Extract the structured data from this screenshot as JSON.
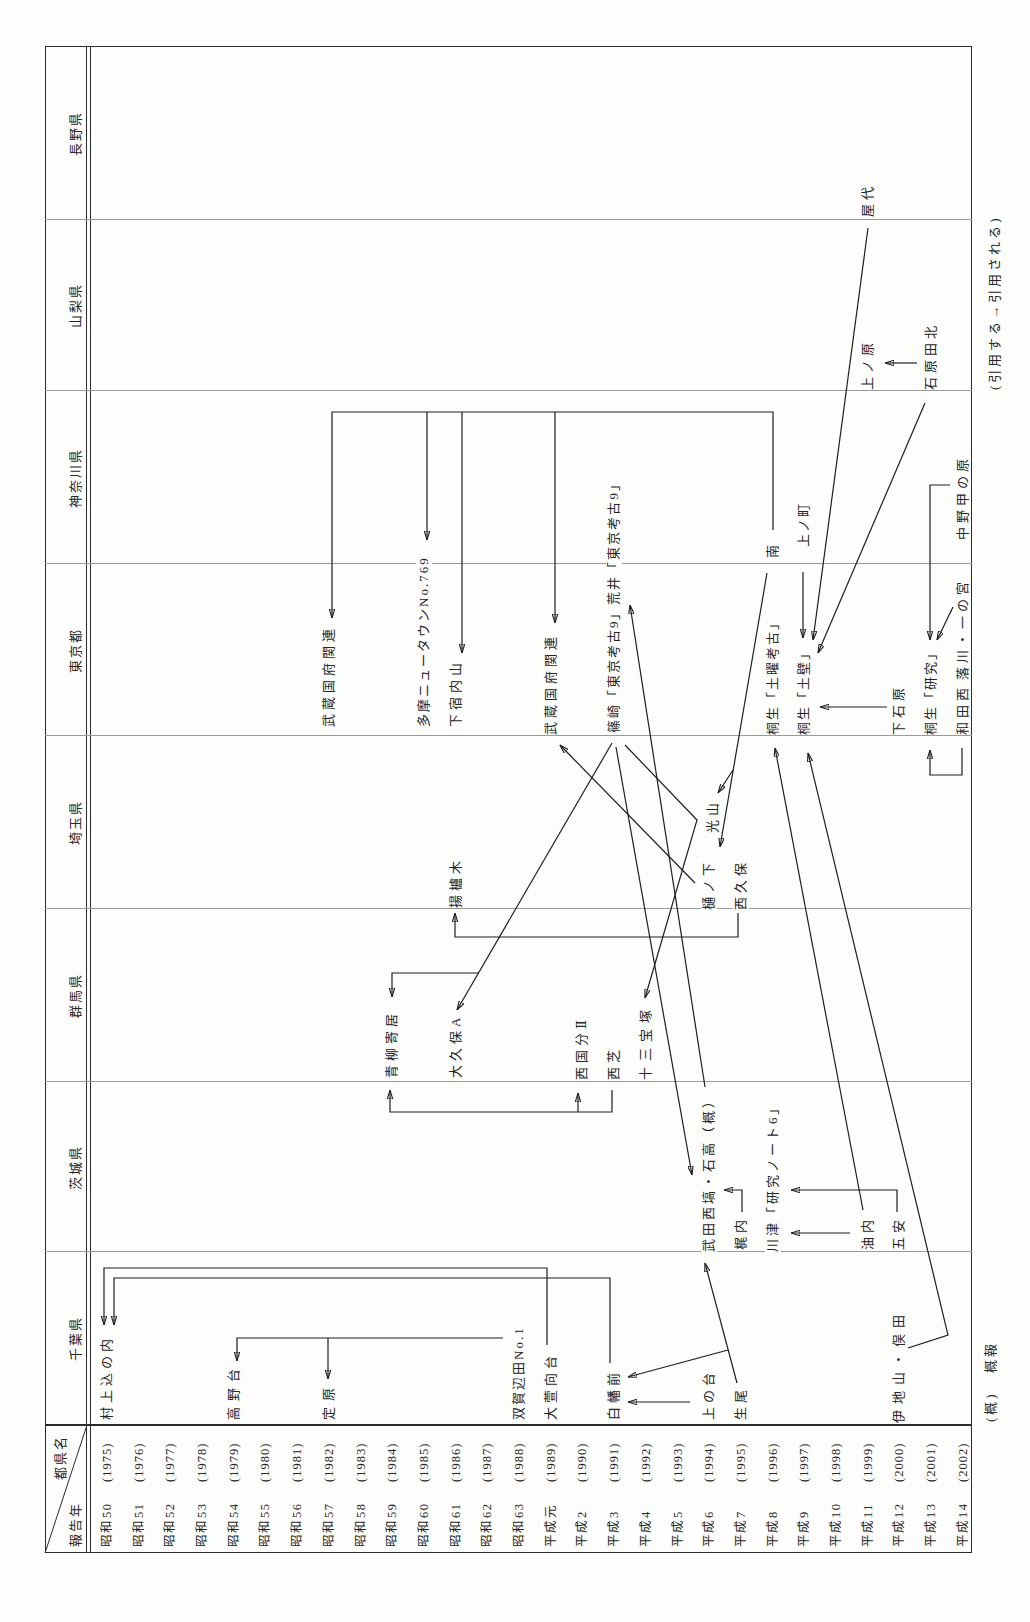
{
  "table": {
    "corner": {
      "column_axis_label": "都県名",
      "row_axis_label": "報告年"
    },
    "prefectures": [
      "千葉県",
      "茨城県",
      "群馬県",
      "埼玉県",
      "東京都",
      "神奈川県",
      "山梨県",
      "長野県"
    ],
    "years": [
      {
        "era": "昭和50",
        "year": "(1975)"
      },
      {
        "era": "昭和51",
        "year": "(1976)"
      },
      {
        "era": "昭和52",
        "year": "(1977)"
      },
      {
        "era": "昭和53",
        "year": "(1978)"
      },
      {
        "era": "昭和54",
        "year": "(1979)"
      },
      {
        "era": "昭和55",
        "year": "(1980)"
      },
      {
        "era": "昭和56",
        "year": "(1981)"
      },
      {
        "era": "昭和57",
        "year": "(1982)"
      },
      {
        "era": "昭和58",
        "year": "(1983)"
      },
      {
        "era": "昭和59",
        "year": "(1984)"
      },
      {
        "era": "昭和60",
        "year": "(1985)"
      },
      {
        "era": "昭和61",
        "year": "(1986)"
      },
      {
        "era": "昭和62",
        "year": "(1987)"
      },
      {
        "era": "昭和63",
        "year": "(1988)"
      },
      {
        "era": "平成元",
        "year": "(1989)"
      },
      {
        "era": "平成2",
        "year": "(1990)"
      },
      {
        "era": "平成3",
        "year": "(1991)"
      },
      {
        "era": "平成4",
        "year": "(1992)"
      },
      {
        "era": "平成5",
        "year": "(1993)"
      },
      {
        "era": "平成6",
        "year": "(1994)"
      },
      {
        "era": "平成7",
        "year": "(1995)"
      },
      {
        "era": "平成8",
        "year": "(1996)"
      },
      {
        "era": "平成9",
        "year": "(1997)"
      },
      {
        "era": "平成10",
        "year": "(1998)"
      },
      {
        "era": "平成11",
        "year": "(1999)"
      },
      {
        "era": "平成12",
        "year": "(2000)"
      },
      {
        "era": "平成13",
        "year": "(2001)"
      },
      {
        "era": "平成14",
        "year": "(2002)"
      }
    ]
  },
  "labels": [
    {
      "text": "村上込の内",
      "prefecture": "千葉県",
      "year": "昭和50"
    },
    {
      "text": "高野台",
      "prefecture": "千葉県",
      "year": "昭和54"
    },
    {
      "text": "定原",
      "prefecture": "千葉県",
      "year": "昭和57"
    },
    {
      "text": "双賀辺田No.1",
      "prefecture": "千葉県",
      "year": "昭和63"
    },
    {
      "text": "大萱向台",
      "prefecture": "千葉県",
      "year": "平成元"
    },
    {
      "text": "白幡前",
      "prefecture": "千葉県",
      "year": "平成3"
    },
    {
      "text": "上の台",
      "prefecture": "千葉県",
      "year": "平成6"
    },
    {
      "text": "生尾",
      "prefecture": "千葉県",
      "year": "平成7"
    },
    {
      "text": "伊地山・俣田",
      "prefecture": "千葉県",
      "year": "平成12"
    },
    {
      "text": "武田西塙・石高（概）",
      "prefecture": "茨城県",
      "year": "平成6"
    },
    {
      "text": "梶内",
      "prefecture": "茨城県",
      "year": "平成7"
    },
    {
      "text": "川津「研究ノート6」",
      "prefecture": "茨城県",
      "year": "平成8"
    },
    {
      "text": "油内",
      "prefecture": "茨城県",
      "year": "平成11"
    },
    {
      "text": "五安",
      "prefecture": "茨城県",
      "year": "平成12"
    },
    {
      "text": "青柳寄居",
      "prefecture": "群馬県",
      "year": "昭和59"
    },
    {
      "text": "大久保A",
      "prefecture": "群馬県",
      "year": "昭和61"
    },
    {
      "text": "西国分Ⅱ",
      "prefecture": "群馬県",
      "year": "平成2"
    },
    {
      "text": "西芝",
      "prefecture": "群馬県",
      "year": "平成3"
    },
    {
      "text": "十三宝塚",
      "prefecture": "群馬県",
      "year": "平成4"
    },
    {
      "text": "揚櫨木",
      "prefecture": "埼玉県",
      "year": "昭和61"
    },
    {
      "text": "樋ノ下",
      "prefecture": "埼玉県",
      "year": "平成6"
    },
    {
      "text": "光山",
      "prefecture": "埼玉県",
      "year": "平成6"
    },
    {
      "text": "西久保",
      "prefecture": "埼玉県",
      "year": "平成7"
    },
    {
      "text": "武蔵国府関連",
      "prefecture": "東京都",
      "year": "昭和57"
    },
    {
      "text": "多摩ニュータウンNo.769",
      "prefecture": "東京都",
      "year": "昭和60"
    },
    {
      "text": "下宿内山",
      "prefecture": "東京都",
      "year": "昭和61"
    },
    {
      "text": "武蔵国府関連",
      "prefecture": "東京都",
      "year": "平成元"
    },
    {
      "text": "篠崎「東京考古9」荒井「東京考古9」",
      "prefecture": "東京都",
      "year": "平成3"
    },
    {
      "text": "桐生「土曜考古」",
      "prefecture": "東京都",
      "year": "平成8"
    },
    {
      "text": "桐生「土壁」",
      "prefecture": "東京都",
      "year": "平成9"
    },
    {
      "text": "下石原",
      "prefecture": "東京都",
      "year": "平成12"
    },
    {
      "text": "桐生「研究」",
      "prefecture": "東京都",
      "year": "平成13"
    },
    {
      "text": "和田西",
      "prefecture": "東京都",
      "year": "平成14"
    },
    {
      "text": "落川・一の宮",
      "prefecture": "東京都",
      "year": "平成14"
    },
    {
      "text": "中野甲の原",
      "prefecture": "神奈川県",
      "year": "平成14"
    },
    {
      "text": "南",
      "prefecture": "神奈川県",
      "year": "平成8"
    },
    {
      "text": "上ノ町",
      "prefecture": "神奈川県",
      "year": "平成9"
    },
    {
      "text": "上ノ原",
      "prefecture": "山梨県",
      "year": "平成11"
    },
    {
      "text": "石原田北",
      "prefecture": "山梨県",
      "year": "平成13"
    },
    {
      "text": "屋代",
      "prefecture": "長野県",
      "year": "平成11"
    }
  ],
  "arrows": [
    {
      "from": "大萱向台",
      "to": "村上込の内"
    },
    {
      "from": "白幡前",
      "to": "村上込の内"
    },
    {
      "from": "双賀辺田No.1",
      "to": "高野台"
    },
    {
      "from": "双賀辺田No.1",
      "to": "定原"
    },
    {
      "from": "上の台",
      "to": "白幡前"
    },
    {
      "from": "生尾",
      "to": "武田西塙・石高（概）"
    },
    {
      "from": "生尾",
      "to": "白幡前"
    },
    {
      "from": "梶内",
      "to": "武田西塙・石高（概）"
    },
    {
      "from": "五安",
      "to": "川津「研究ノート6」"
    },
    {
      "from": "油内",
      "to": "川津「研究ノート6」"
    },
    {
      "from": "油内",
      "to": "桐生「土曜考古」"
    },
    {
      "from": "伊地山・俣田",
      "to": "桐生「土壁」"
    },
    {
      "from": "武田西塙・石高（概）",
      "to": "荒井「東京考古9」"
    },
    {
      "from": "篠崎「東京考古9」",
      "to": "武田西塙・石高（概）"
    },
    {
      "from": "篠崎「東京考古9」",
      "to": "大久保A"
    },
    {
      "from": "篠崎「東京考古9」",
      "to": "青柳寄居"
    },
    {
      "from": "篠崎「東京考古9」",
      "to": "十三宝塚"
    },
    {
      "from": "樋ノ下",
      "to": "武蔵国府関連 (平成元)"
    },
    {
      "from": "南",
      "to": "樋ノ下"
    },
    {
      "from": "南",
      "to": "光山"
    },
    {
      "from": "南",
      "to": "武蔵国府関連 (昭和57)"
    },
    {
      "from": "南",
      "to": "多摩ニュータウンNo.769"
    },
    {
      "from": "南",
      "to": "下宿内山"
    },
    {
      "from": "南",
      "to": "武蔵国府関連 (平成元)"
    },
    {
      "from": "西芝",
      "to": "青柳寄居"
    },
    {
      "from": "西芝",
      "to": "西国分Ⅱ"
    },
    {
      "from": "西久保",
      "to": "揚櫨木"
    },
    {
      "from": "上ノ町",
      "to": "桐生「土壁」"
    },
    {
      "from": "屋代",
      "to": "桐生「土壁」"
    },
    {
      "from": "石原田北",
      "to": "桐生「土壁」"
    },
    {
      "from": "石原田北",
      "to": "上ノ原"
    },
    {
      "from": "下石原",
      "to": "桐生「土壁」"
    },
    {
      "from": "中野甲の原",
      "to": "桐生「研究」"
    },
    {
      "from": "落川・一の宮",
      "to": "桐生「研究」"
    },
    {
      "from": "和田西",
      "to": "桐生「研究」"
    }
  ],
  "footer": {
    "abbrev_key": "(概)",
    "abbrev_meaning": "概報",
    "arrow_legend": "(引用する→引用される)"
  }
}
